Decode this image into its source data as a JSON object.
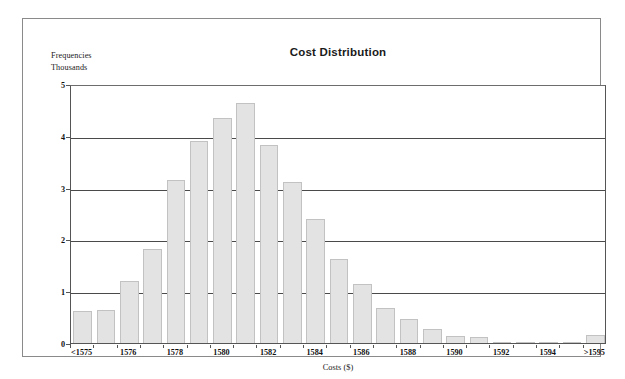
{
  "figure": {
    "title": "Cost Distribution",
    "y_caption_line1": "Frequencies",
    "y_caption_line2": "Thousands",
    "x_axis_title": "Costs ($)",
    "bar_fill_color": "#e3e3e3",
    "bar_border_color": "#c2c2c2",
    "gridline_color": "#4a4a4a",
    "frame_color": "#8a8a8a"
  },
  "chart_data": {
    "type": "bar",
    "title": "Cost Distribution",
    "subtitle": "",
    "xlabel": "Costs ($)",
    "ylabel": "Frequencies Thousands",
    "ylim": [
      0,
      5
    ],
    "yticks": [
      0,
      1,
      2,
      3,
      4,
      5
    ],
    "ytick_labels": [
      "0",
      "1",
      "2",
      "3",
      "4",
      "5"
    ],
    "grid": true,
    "grid_axis": "y",
    "legend": false,
    "legend_position": "none",
    "categories": [
      "<1575",
      "1575",
      "1576",
      "1577",
      "1578",
      "1579",
      "1580",
      "1581",
      "1582",
      "1583",
      "1584",
      "1585",
      "1586",
      "1587",
      "1588",
      "1589",
      "1590",
      "1591",
      "1592",
      "1593",
      "1594",
      "1595",
      ">1595"
    ],
    "values": [
      0.62,
      0.63,
      1.2,
      1.82,
      3.14,
      3.9,
      4.34,
      4.63,
      3.82,
      3.1,
      2.4,
      1.63,
      1.14,
      0.68,
      0.47,
      0.27,
      0.14,
      0.11,
      0.02,
      0.01,
      0.01,
      0.01,
      0.15
    ],
    "xtick_labels": [
      "<1575",
      "1576",
      "1578",
      "1580",
      "1582",
      "1584",
      "1586",
      "1588",
      "1590",
      "1592",
      "1594",
      ">1595"
    ],
    "xtick_category_index": [
      0,
      2,
      4,
      6,
      8,
      10,
      12,
      14,
      16,
      18,
      20,
      22
    ]
  }
}
